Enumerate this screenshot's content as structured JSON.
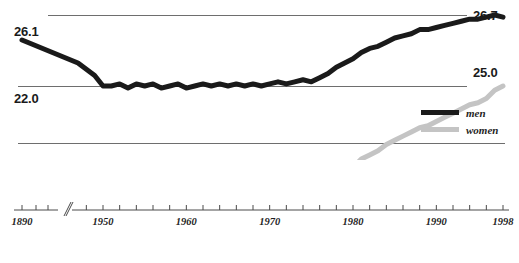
{
  "chart_data": {
    "type": "line",
    "title": "",
    "subtitle": "",
    "xlabel": "",
    "ylabel": "",
    "grid": false,
    "legend_position": "bottom-right",
    "xlim": [
      1890,
      1998
    ],
    "ylim": [
      22.0,
      26.7
    ],
    "axis_break": {
      "present": true,
      "after": 1890,
      "before": 1947,
      "glyph": "//"
    },
    "annotations": {
      "left_top": "26.1",
      "left_bottom": "22.0",
      "right_top": "26.7",
      "right_middle": "25.0"
    },
    "reference_lines": [
      26.7,
      25.0,
      22.0
    ],
    "xticks_labeled": [
      "1890",
      "1950",
      "1960",
      "1970",
      "1980",
      "1990",
      "1998"
    ],
    "xtick_interval_years": 2,
    "series": [
      {
        "name": "men",
        "color": "#1a1a1a",
        "x": [
          1890,
          1947,
          1948,
          1949,
          1950,
          1951,
          1952,
          1953,
          1954,
          1955,
          1956,
          1957,
          1958,
          1959,
          1960,
          1961,
          1962,
          1963,
          1964,
          1965,
          1966,
          1967,
          1968,
          1969,
          1970,
          1971,
          1972,
          1973,
          1974,
          1975,
          1976,
          1977,
          1978,
          1979,
          1980,
          1981,
          1982,
          1983,
          1984,
          1985,
          1986,
          1987,
          1988,
          1989,
          1990,
          1991,
          1992,
          1993,
          1994,
          1995,
          1996,
          1997,
          1998
        ],
        "values": [
          26.1,
          25.55,
          25.4,
          25.25,
          25.0,
          25.0,
          25.05,
          24.95,
          25.05,
          25.0,
          25.05,
          24.95,
          25.0,
          25.05,
          24.95,
          25.0,
          25.05,
          25.0,
          25.05,
          25.0,
          25.05,
          25.0,
          25.05,
          25.0,
          25.05,
          25.1,
          25.05,
          25.1,
          25.15,
          25.1,
          25.2,
          25.3,
          25.45,
          25.55,
          25.65,
          25.8,
          25.9,
          25.95,
          26.05,
          26.15,
          26.2,
          26.25,
          26.35,
          26.35,
          26.4,
          26.45,
          26.5,
          26.55,
          26.6,
          26.6,
          26.65,
          26.7,
          26.65
        ]
      },
      {
        "name": "women",
        "color": "#c4c4c4",
        "x": [
          1890,
          1947,
          1948,
          1949,
          1950,
          1951,
          1952,
          1953,
          1954,
          1955,
          1956,
          1957,
          1958,
          1959,
          1960,
          1961,
          1962,
          1963,
          1964,
          1965,
          1966,
          1967,
          1968,
          1969,
          1970,
          1971,
          1972,
          1973,
          1974,
          1975,
          1976,
          1977,
          1978,
          1979,
          1980,
          1981,
          1982,
          1983,
          1984,
          1985,
          1986,
          1987,
          1988,
          1989,
          1990,
          1991,
          1992,
          1993,
          1994,
          1995,
          1996,
          1997,
          1998
        ],
        "values": [
          22.6,
          22.5,
          22.45,
          22.3,
          22.05,
          22.05,
          22.1,
          22.05,
          22.1,
          22.05,
          22.1,
          22.05,
          22.1,
          22.1,
          22.05,
          22.1,
          22.15,
          22.1,
          22.15,
          22.1,
          22.15,
          22.2,
          22.2,
          22.25,
          22.2,
          22.25,
          22.3,
          22.3,
          22.35,
          22.4,
          22.5,
          22.65,
          22.8,
          22.95,
          23.05,
          23.25,
          23.35,
          23.45,
          23.6,
          23.7,
          23.8,
          23.9,
          24.0,
          24.05,
          24.15,
          24.25,
          24.35,
          24.45,
          24.55,
          24.6,
          24.7,
          24.9,
          25.0
        ]
      }
    ]
  },
  "legend": {
    "items": [
      {
        "label": "men",
        "color": "#1a1a1a"
      },
      {
        "label": "women",
        "color": "#c4c4c4"
      }
    ]
  },
  "axis_labels": {
    "left_top": "26.1",
    "left_bottom": "22.0",
    "right_top": "26.7",
    "right_middle": "25.0"
  },
  "xaxis": {
    "ticks": [
      {
        "label": "1890",
        "year": 1890
      },
      {
        "label": "1950",
        "year": 1950
      },
      {
        "label": "1960",
        "year": 1960
      },
      {
        "label": "1970",
        "year": 1970
      },
      {
        "label": "1980",
        "year": 1980
      },
      {
        "label": "1990",
        "year": 1990
      },
      {
        "label": "1998",
        "year": 1998
      }
    ],
    "break_glyph": "//"
  },
  "colors": {
    "men": "#1a1a1a",
    "women": "#c4c4c4",
    "rule": "#6e6e6e",
    "axis": "#4a4a4a",
    "text": "#1a1a1a",
    "background": "#ffffff"
  }
}
